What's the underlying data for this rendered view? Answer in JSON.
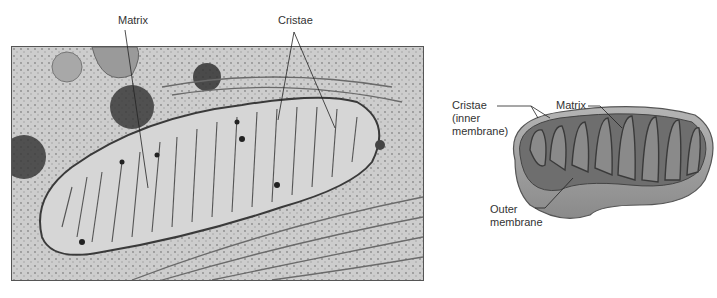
{
  "figure": {
    "photo_panel": {
      "description": "Electron micrograph of a mitochondrion",
      "labels": {
        "matrix": "Matrix",
        "cristae": "Cristae"
      }
    },
    "illustration_panel": {
      "description": "3D cutaway illustration of a mitochondrion",
      "labels": {
        "cristae_line1": "Cristae",
        "cristae_line2": "(inner",
        "cristae_line3": "membrane)",
        "matrix": "Matrix",
        "outer_line1": "Outer",
        "outer_line2": "membrane"
      }
    },
    "colors": {
      "label_text": "#333333",
      "leader_line": "#222222",
      "photo_bg": "#cfcfcf",
      "organelle_fill": "#d9d9d9",
      "membrane": "#3a3a3a",
      "illustration_outer": "#9a9a9a",
      "illustration_inner": "#6e6e6e"
    }
  }
}
